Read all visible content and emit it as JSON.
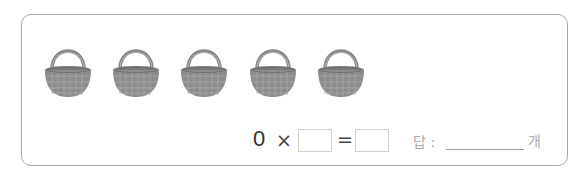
{
  "problem": {
    "baskets": [
      {
        "id": 1,
        "icon": "basket-icon",
        "left": 44
      },
      {
        "id": 2,
        "icon": "basket-icon",
        "left": 112
      },
      {
        "id": 3,
        "icon": "basket-icon",
        "left": 180
      },
      {
        "id": 4,
        "icon": "basket-icon",
        "left": 249
      },
      {
        "id": 5,
        "icon": "basket-icon",
        "left": 317
      }
    ],
    "equation": {
      "first_operand": "0",
      "operator": "×",
      "second_operand": "",
      "equals": "=",
      "result": ""
    },
    "answer": {
      "label": "답 :",
      "value": "",
      "unit": "개"
    }
  },
  "colors": {
    "basket": "#8a8a8a",
    "border": "#a8a8a8"
  }
}
